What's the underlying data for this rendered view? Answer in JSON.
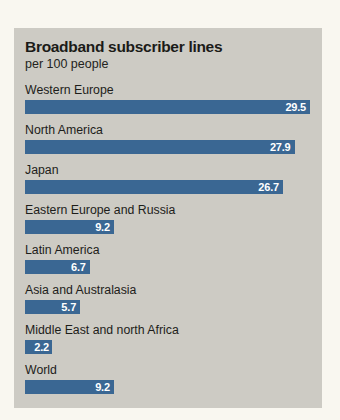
{
  "chart_data": {
    "type": "bar",
    "title": "Broadband subscriber lines",
    "subtitle": "per 100 people",
    "xlabel": "",
    "ylabel": "",
    "orientation": "horizontal",
    "grid": false,
    "legend": false,
    "xlim": [
      0,
      29.5
    ],
    "bar_color": "#3a6793",
    "panel_color": "#cdcbc4",
    "page_color": "#f9f7f0",
    "value_label_color": "#ffffff",
    "categories": [
      "Western Europe",
      "North America",
      "Japan",
      "Eastern Europe and Russia",
      "Latin America",
      "Asia and Australasia",
      "Middle East and north Africa",
      "World"
    ],
    "values": [
      29.5,
      27.9,
      26.7,
      9.2,
      6.7,
      5.7,
      2.2,
      9.2
    ],
    "value_labels": [
      "29.5",
      "27.9",
      "26.7",
      "9.2",
      "6.7",
      "5.7",
      "2.2",
      "9.2"
    ]
  }
}
